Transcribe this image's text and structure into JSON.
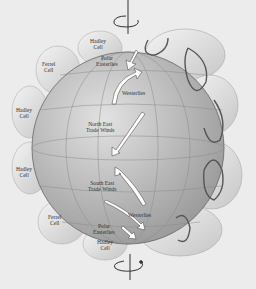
{
  "diagram": {
    "colors": {
      "background": "#ececec",
      "globe": "#c4c4c4",
      "cell": "#dadada",
      "arrow": "#ffffff",
      "outline": "#555555"
    },
    "left_labels": [
      {
        "id": "hadley_top",
        "text1": "Hadley",
        "text2": "Cell"
      },
      {
        "id": "ferrel_n",
        "text1": "Ferrel",
        "text2": "Cell"
      },
      {
        "id": "hadley_n",
        "text1": "Hadley",
        "text2": "Cell"
      },
      {
        "id": "hadley_s",
        "text1": "Hadley",
        "text2": "Cell"
      },
      {
        "id": "ferrel_s",
        "text1": "Ferrel",
        "text2": "Cell"
      },
      {
        "id": "hadley_bottom",
        "text1": "Hadley",
        "text2": "Cell"
      }
    ],
    "wind_labels": [
      {
        "id": "polar_n",
        "text1": "Polar",
        "text2": "Easterlies"
      },
      {
        "id": "westerlies_n",
        "text1": "Westerlies",
        "text2": ""
      },
      {
        "id": "ne_trades",
        "text1": "North East",
        "text2": "Trade Winds"
      },
      {
        "id": "se_trades",
        "text1": "South East",
        "text2": "Trade Winds"
      },
      {
        "id": "westerlies_s",
        "text1": "Westerlies",
        "text2": ""
      },
      {
        "id": "polar_s",
        "text1": "Polar",
        "text2": "Easterlies"
      }
    ],
    "rotation_axis": {
      "top_icon": "rotation-arrow-icon",
      "bottom_icon": "rotation-arrow-icon"
    }
  }
}
